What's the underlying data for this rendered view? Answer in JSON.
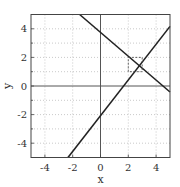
{
  "chart_data": {
    "type": "line",
    "title": "",
    "xlabel": "x",
    "ylabel": "y",
    "xlim": [
      -5,
      5
    ],
    "ylim": [
      -5,
      5
    ],
    "x_ticks": [
      -4,
      -2,
      0,
      2,
      4
    ],
    "y_ticks": [
      -4,
      -2,
      0,
      2,
      4
    ],
    "x_tick_labels": [
      "-4",
      "-2",
      "0",
      "2",
      "4"
    ],
    "y_tick_labels": [
      "-4",
      "-2",
      "0",
      "2",
      "4"
    ],
    "grid": true,
    "grid_style": "dotted",
    "legend": null,
    "series": [
      {
        "name": "line-1",
        "equation": "y = -0.833x + 3.75",
        "x": [
          -1.5,
          5
        ],
        "y": [
          5,
          -0.42
        ],
        "color": "#222222"
      },
      {
        "name": "line-2",
        "equation": "y = 1.25x - 2.08",
        "x": [
          -2.34,
          5
        ],
        "y": [
          -5,
          4.17
        ],
        "color": "#222222"
      }
    ],
    "annotations": [
      {
        "type": "dashed-rectangle",
        "x": [
          2,
          3
        ],
        "y": [
          1,
          2
        ],
        "note": "box around intersection point (~2.8, 1.42)"
      }
    ],
    "reference_lines": [
      {
        "orientation": "vertical",
        "value": 0
      },
      {
        "orientation": "horizontal",
        "value": 0
      }
    ]
  }
}
